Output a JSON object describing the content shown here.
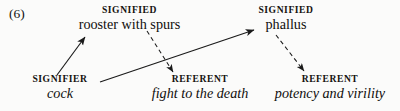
{
  "figure": {
    "equation_number": "(6)",
    "background_color": "#fbfbfa",
    "ink_color": "#1a1a1a"
  },
  "nodes": {
    "signified_left": {
      "kind": "SIGNIFIED",
      "term": "rooster with spurs",
      "style": "roman"
    },
    "signified_right": {
      "kind": "SIGNIFIED",
      "term": "phallus",
      "style": "roman"
    },
    "signifier": {
      "kind": "SIGNIFIER",
      "term": "cock",
      "style": "italic"
    },
    "referent_mid": {
      "kind": "REFERENT",
      "term": "fight to the death",
      "style": "italic"
    },
    "referent_right": {
      "kind": "REFERENT",
      "term": "potency and virility",
      "style": "italic"
    }
  },
  "arrows": [
    {
      "name": "signifier-to-signified-left",
      "line_style": "solid",
      "from": "signifier",
      "to": "signified_left",
      "x1": 57,
      "y1": 75,
      "x2": 85,
      "y2": 37
    },
    {
      "name": "signifier-to-signified-right",
      "line_style": "solid",
      "from": "signifier",
      "to": "signified_right",
      "x1": 100,
      "y1": 82,
      "x2": 254,
      "y2": 30
    },
    {
      "name": "signified-left-to-referent-mid",
      "line_style": "dashed",
      "from": "signified_left",
      "to": "referent_mid",
      "x1": 147,
      "y1": 31,
      "x2": 173,
      "y2": 72
    },
    {
      "name": "signified-right-to-referent-right",
      "line_style": "dashed",
      "from": "signified_right",
      "to": "referent_right",
      "x1": 276,
      "y1": 35,
      "x2": 304,
      "y2": 71
    }
  ]
}
